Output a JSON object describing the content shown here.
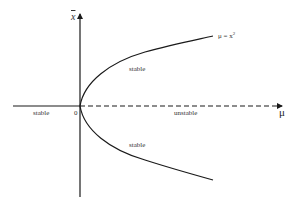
{
  "diagram": {
    "type": "bifurcation-diagram",
    "axes": {
      "x_label": "μ",
      "y_label": "x",
      "origin_label": "0"
    },
    "curve": {
      "equation_label": "μ = x",
      "equation_exponent": "2"
    },
    "branches": {
      "upper_label": "stable",
      "lower_label": "stable",
      "left_axis_label": "stable",
      "right_axis_label": "unstable"
    },
    "colors": {
      "line": "#1a1a1a",
      "text": "#333333"
    }
  }
}
